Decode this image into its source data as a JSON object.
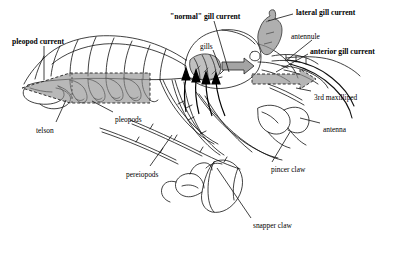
{
  "figure": {
    "kind": "scientific-anatomy-diagram",
    "background_color": "#ffffff",
    "line_color": "#111111",
    "shade_color": "#8d8d8d",
    "width": 404,
    "height": 259
  },
  "labels": [
    {
      "id": "pleopod-current",
      "text": "pleopod current",
      "weight": "bold",
      "x": 12,
      "y": 37,
      "size": 7.6
    },
    {
      "id": "normal-gill-current",
      "text": "\"normal\" gill current",
      "weight": "bold",
      "x": 170,
      "y": 12,
      "size": 7.6
    },
    {
      "id": "lateral-gill-current",
      "text": "lateral gill current",
      "weight": "bold",
      "x": 296,
      "y": 8,
      "size": 7.6
    },
    {
      "id": "antennule",
      "text": "antennule",
      "weight": "normal",
      "x": 291,
      "y": 32,
      "size": 7.4
    },
    {
      "id": "anterior-gill-current",
      "text": "anterior gill current",
      "weight": "bold",
      "x": 310,
      "y": 47,
      "size": 7.6
    },
    {
      "id": "gills",
      "text": "gills",
      "weight": "normal",
      "x": 200,
      "y": 42,
      "size": 7.4
    },
    {
      "id": "third-maxilliped",
      "text": "3rd maxilliped",
      "weight": "normal",
      "x": 314,
      "y": 93,
      "size": 7.4
    },
    {
      "id": "antenna",
      "text": "antenna",
      "weight": "normal",
      "x": 323,
      "y": 125,
      "size": 7.4
    },
    {
      "id": "telson",
      "text": "telson",
      "weight": "normal",
      "x": 36,
      "y": 126,
      "size": 7.4
    },
    {
      "id": "pleopods",
      "text": "pleopods",
      "weight": "normal",
      "x": 115,
      "y": 115,
      "size": 7.4
    },
    {
      "id": "pereiopods",
      "text": "pereiopods",
      "weight": "normal",
      "x": 126,
      "y": 170,
      "size": 7.4
    },
    {
      "id": "pincer-claw",
      "text": "pincer claw",
      "weight": "normal",
      "x": 271,
      "y": 165,
      "size": 7.4
    },
    {
      "id": "snapper-claw",
      "text": "snapper claw",
      "weight": "normal",
      "x": 253,
      "y": 221,
      "size": 7.4
    }
  ],
  "leader_lines": [
    {
      "id": "leader-pleopod-current",
      "from": [
        44,
        46
      ],
      "to": [
        44,
        80
      ]
    },
    {
      "id": "leader-normal-gill-current",
      "from": [
        214,
        21
      ],
      "to": [
        229,
        72
      ]
    },
    {
      "id": "leader-lateral-gill-current",
      "from": [
        293,
        14
      ],
      "to": [
        268,
        21
      ]
    },
    {
      "id": "leader-antennule",
      "from": [
        312,
        40
      ],
      "to": [
        287,
        60
      ]
    },
    {
      "id": "leader-anterior-gill-current",
      "from": [
        308,
        54
      ],
      "to": [
        276,
        72
      ]
    },
    {
      "id": "leader-gills",
      "from": [
        213,
        50
      ],
      "to": [
        220,
        68
      ]
    },
    {
      "id": "leader-3rd-maxilliped",
      "from": [
        311,
        91
      ],
      "to": [
        296,
        88
      ]
    },
    {
      "id": "leader-antenna",
      "from": [
        320,
        123
      ],
      "to": [
        300,
        118
      ]
    },
    {
      "id": "leader-telson",
      "from": [
        56,
        122
      ],
      "to": [
        66,
        100
      ]
    },
    {
      "id": "leader-pleopods",
      "from": [
        113,
        112
      ],
      "to": [
        92,
        101
      ]
    },
    {
      "id": "leader-pereiopods",
      "from": [
        150,
        166
      ],
      "to": [
        172,
        135
      ]
    },
    {
      "id": "leader-pincer-claw",
      "from": [
        272,
        162
      ],
      "to": [
        290,
        132
      ]
    },
    {
      "id": "leader-snapper-claw",
      "from": [
        251,
        218
      ],
      "to": [
        217,
        168
      ]
    }
  ],
  "current_arrows": [
    {
      "id": "pleopod-current-arrow",
      "style": "gray-dashed-outline",
      "direction": "left",
      "note": "broad shaded arrow along abdomen pointing posteriorly"
    },
    {
      "id": "anterior-gill-current-arrow",
      "style": "gray-dashed-outline",
      "direction": "right",
      "note": "shaded arrow beneath antennule pointing anteriorly"
    },
    {
      "id": "lateral-gill-current-arrow",
      "style": "gray-irregular",
      "direction": "up-left",
      "note": "shaded plume above carapace"
    },
    {
      "id": "normal-gill-current-arrow",
      "style": "gray-solid",
      "direction": "right",
      "note": "small shaded arrow exiting gill chamber"
    },
    {
      "id": "gill-inflow-arrows",
      "style": "black-solid",
      "direction": "up",
      "count": 4,
      "note": "black curved arrows entering gill chamber from below"
    }
  ]
}
